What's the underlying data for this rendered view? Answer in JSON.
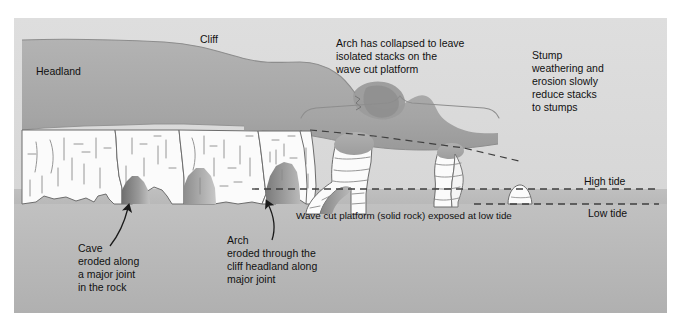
{
  "diagram": {
    "type": "geological-cross-section",
    "labels": {
      "headland": "Headland",
      "cliff": "Cliff",
      "arch_collapsed": [
        "Arch has collapsed to leave",
        "isolated stacks on the",
        "wave cut platform"
      ],
      "stump": [
        "Stump",
        "weathering and",
        "erosion slowly",
        "reduce stacks",
        "to stumps"
      ],
      "high_tide": "High tide",
      "low_tide": "Low tide",
      "wave_cut_platform": "Wave cut platform (solid rock) exposed at low tide",
      "cave": [
        "Cave",
        "eroded along",
        "a major joint",
        "in the rock"
      ],
      "arch": [
        "Arch",
        "eroded through the",
        "cliff headland along",
        "major joint"
      ]
    },
    "colors": {
      "background": "#ffffff",
      "sky": "#d9d9d9",
      "headland_top": "#a8a8a8",
      "headland_shadow": "#8f8f8f",
      "rock_face": "#fbfbfb",
      "rock_outline": "#6d6d6d",
      "joint_line": "#8a8a8a",
      "platform": "#b5b5b5",
      "sea_below": "#bdbdbd",
      "cave_dark": "#7e7e7e",
      "text": "#111111",
      "tide_line": "#4a4a4a",
      "arrow": "#1a1a1a",
      "brace": "#8a8a8a"
    }
  }
}
